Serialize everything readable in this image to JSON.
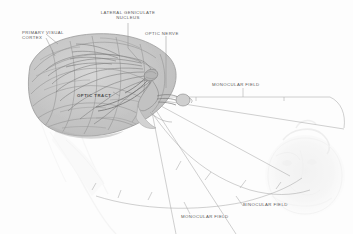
{
  "figure": {
    "style": "grayscale pencil/ink anatomical drawing",
    "background_color": "#fdfdfd",
    "label_color": "#585858",
    "ink_color": "#7d7d7d"
  },
  "labels": {
    "primary_visual_cortex": "PRIMARY VISUAL\nCORTEX",
    "primary_visual_cortex_line1": "PRIMARY VISUAL",
    "primary_visual_cortex_line2": "CORTEX",
    "lateral_geniculate_nucleus_line1": "LATERAL GENICULATE",
    "lateral_geniculate_nucleus_line2": "NUCLEUS",
    "optic_nerve": "OPTIC NERVE",
    "optic_tract": "OPTIC TRACT",
    "monocular_field_upper": "MONOCULAR FIELD",
    "monocular_field_lower": "MONOCULAR FIELD",
    "binocular_field": "BINOCULAR FIELD"
  },
  "structures": [
    {
      "name": "brain-hemisphere",
      "description": "sagittal cerebral hemisphere with gyri and sulci, upper left"
    },
    {
      "name": "optic-radiation-fibers",
      "description": "fanned fiber bundles from LGN to occipital cortex"
    },
    {
      "name": "lateral-geniculate-nucleus",
      "description": "thalamic relay nucleus, mid brain"
    },
    {
      "name": "optic-tract",
      "description": "fiber tract from chiasm to LGN"
    },
    {
      "name": "optic-chiasm",
      "description": "crossing point of optic nerves"
    },
    {
      "name": "optic-nerve",
      "description": "nerve from eye to chiasm"
    },
    {
      "name": "head-profile",
      "description": "faint ghosted head/face at right"
    },
    {
      "name": "visual-field-projection",
      "description": "radiating projection lines and field arcs to the right"
    }
  ]
}
